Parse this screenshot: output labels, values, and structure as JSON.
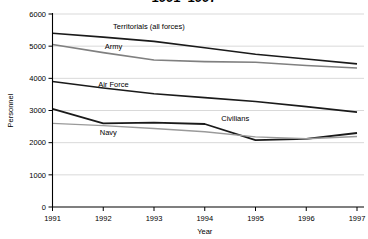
{
  "chart_data": {
    "type": "line",
    "title": "1991–1997",
    "xlabel": "Year",
    "ylabel": "Personnel",
    "x": [
      1991,
      1992,
      1993,
      1994,
      1995,
      1996,
      1997
    ],
    "xlim": [
      1991,
      1997
    ],
    "ylim": [
      0,
      6000
    ],
    "yticks": [
      0,
      1000,
      2000,
      3000,
      4000,
      5000,
      6000
    ],
    "ytick_labels": [
      "0",
      "1000",
      "2000",
      "3000",
      "4000",
      "5000",
      "6000"
    ],
    "xtick_labels": [
      "1991",
      "1992",
      "1993",
      "1994",
      "1995",
      "1996",
      "1997"
    ],
    "grid": true,
    "legend": "inline-labels",
    "series": [
      {
        "name": "Territorials (all forces)",
        "color": "#1a1a1a",
        "width": 1.6,
        "values": [
          5400,
          5280,
          5150,
          4950,
          4750,
          4600,
          4450
        ]
      },
      {
        "name": "Army",
        "color": "#808080",
        "width": 1.6,
        "values": [
          5050,
          4800,
          4570,
          4520,
          4500,
          4400,
          4320
        ]
      },
      {
        "name": "Air Force",
        "color": "#1a1a1a",
        "width": 1.6,
        "values": [
          3900,
          3700,
          3520,
          3400,
          3280,
          3120,
          2950
        ]
      },
      {
        "name": "Civilians",
        "color": "#1a1a1a",
        "width": 1.8,
        "values": [
          3050,
          2600,
          2620,
          2580,
          2080,
          2120,
          2300
        ]
      },
      {
        "name": "Navy",
        "color": "#9a9a9a",
        "width": 1.4,
        "values": [
          2600,
          2530,
          2440,
          2340,
          2180,
          2120,
          2190
        ]
      }
    ],
    "series_label_positions": [
      {
        "name": "Territorials (all forces)",
        "x": 1992.9,
        "y": 5620
      },
      {
        "name": "Army",
        "x": 1992.2,
        "y": 5000
      },
      {
        "name": "Air Force",
        "x": 1992.2,
        "y": 3820
      },
      {
        "name": "Civilians",
        "x": 1994.6,
        "y": 2760
      },
      {
        "name": "Navy",
        "x": 1992.1,
        "y": 2320
      }
    ]
  }
}
